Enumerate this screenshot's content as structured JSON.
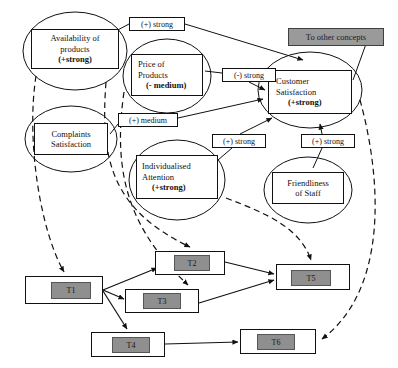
{
  "diagram": {
    "colors": {
      "line": "#111111",
      "node_fill": "#ffffff",
      "sink_fill": "#9a9a9a",
      "task_inner_fill": "#8f8f8f",
      "task_outer_fill": "#ffffff"
    },
    "concept_nodes": [
      {
        "id": "availability",
        "name": "availability-of-products",
        "line1": "Availability of",
        "line2": "products",
        "strength": "(+strong)",
        "shape": "ellipse",
        "box": {
          "x": 31,
          "y": 29,
          "w": 88,
          "h": 40
        },
        "ellipse": {
          "cx": 75,
          "cy": 51,
          "rx": 52,
          "ry": 39
        }
      },
      {
        "id": "price",
        "name": "price-of-products",
        "line1": "Price of",
        "line2": "Products",
        "strength": "(- medium)",
        "shape": "ellipse",
        "box": {
          "x": 131,
          "y": 54,
          "w": 72,
          "h": 42
        },
        "ellipse": {
          "cx": 167,
          "cy": 76,
          "rx": 44,
          "ry": 37
        }
      },
      {
        "id": "complaints",
        "name": "complaints-satisfaction",
        "line1": "Complaints",
        "line2": "Satisfaction",
        "strength": "",
        "shape": "ellipse",
        "box": {
          "x": 34,
          "y": 123,
          "w": 74,
          "h": 32
        },
        "ellipse": {
          "cx": 71,
          "cy": 139,
          "rx": 46,
          "ry": 33
        }
      },
      {
        "id": "customer",
        "name": "customer-satisfaction",
        "line1": "Customer",
        "line2": "Satisfaction",
        "strength": "(+strong)",
        "shape": "ellipse",
        "box": {
          "x": 268,
          "y": 70,
          "w": 84,
          "h": 44
        },
        "ellipse": {
          "cx": 310,
          "cy": 90,
          "rx": 52,
          "ry": 38
        }
      },
      {
        "id": "individualised",
        "name": "individualised-attention",
        "line1": "Individualised",
        "line2": "Attention",
        "strength": "(+strong)",
        "shape": "ellipse",
        "box": {
          "x": 136,
          "y": 155,
          "w": 82,
          "h": 44
        },
        "ellipse": {
          "cx": 177,
          "cy": 180,
          "rx": 48,
          "ry": 40
        }
      },
      {
        "id": "friendliness",
        "name": "friendliness-of-staff",
        "line1": "Friendliness",
        "line2": "of Staff",
        "strength": "",
        "shape": "ellipse",
        "box": {
          "x": 272,
          "y": 172,
          "w": 72,
          "h": 32
        },
        "ellipse": {
          "cx": 308,
          "cy": 190,
          "rx": 44,
          "ry": 33
        }
      }
    ],
    "sink_node": {
      "id": "other",
      "name": "to-other-concepts",
      "label": "To other concepts",
      "box": {
        "x": 288,
        "y": 28,
        "w": 96,
        "h": 18
      }
    },
    "edge_labels": [
      {
        "id": "el1",
        "name": "edge-label-plus-strong-availability",
        "text": "(+) strong",
        "box": {
          "x": 129,
          "y": 17,
          "w": 56,
          "h": 14
        }
      },
      {
        "id": "el2",
        "name": "edge-label-minus-strong-price",
        "text": "(-) strong",
        "box": {
          "x": 222,
          "y": 68,
          "w": 54,
          "h": 14
        }
      },
      {
        "id": "el3",
        "name": "edge-label-plus-medium-complaints",
        "text": "(+) medium",
        "box": {
          "x": 118,
          "y": 113,
          "w": 60,
          "h": 14
        }
      },
      {
        "id": "el4",
        "name": "edge-label-plus-strong-attention",
        "text": "(+) strong",
        "box": {
          "x": 212,
          "y": 134,
          "w": 54,
          "h": 14
        }
      },
      {
        "id": "el5",
        "name": "edge-label-plus-strong-friendliness",
        "text": "(+) strong",
        "box": {
          "x": 301,
          "y": 134,
          "w": 54,
          "h": 14
        }
      }
    ],
    "task_nodes": [
      {
        "id": "T1",
        "name": "task-node-t1",
        "label": "T1",
        "outer": {
          "x": 25,
          "y": 276,
          "w": 78,
          "h": 28
        },
        "inner": {
          "x": 51,
          "y": 282,
          "w": 40,
          "h": 17
        }
      },
      {
        "id": "T2",
        "name": "task-node-t2",
        "label": "T2",
        "outer": {
          "x": 155,
          "y": 251,
          "w": 70,
          "h": 24
        },
        "inner": {
          "x": 174,
          "y": 255,
          "w": 36,
          "h": 16
        }
      },
      {
        "id": "T3",
        "name": "task-node-t3",
        "label": "T3",
        "outer": {
          "x": 125,
          "y": 289,
          "w": 74,
          "h": 24
        },
        "inner": {
          "x": 143,
          "y": 293,
          "w": 38,
          "h": 16
        }
      },
      {
        "id": "T4",
        "name": "task-node-t4",
        "label": "T4",
        "outer": {
          "x": 91,
          "y": 332,
          "w": 74,
          "h": 25
        },
        "inner": {
          "x": 112,
          "y": 337,
          "w": 38,
          "h": 16
        }
      },
      {
        "id": "T5",
        "name": "task-node-t5",
        "label": "T5",
        "outer": {
          "x": 276,
          "y": 264,
          "w": 74,
          "h": 26
        },
        "inner": {
          "x": 291,
          "y": 270,
          "w": 40,
          "h": 16
        }
      },
      {
        "id": "T6",
        "name": "task-node-t6",
        "label": "T6",
        "outer": {
          "x": 240,
          "y": 329,
          "w": 76,
          "h": 25
        },
        "inner": {
          "x": 257,
          "y": 334,
          "w": 38,
          "h": 16
        }
      }
    ],
    "relations": [
      {
        "from": "availability",
        "to": "customer",
        "sign": "+",
        "strength": "strong",
        "style": "solid"
      },
      {
        "from": "price",
        "to": "customer",
        "sign": "-",
        "strength": "strong",
        "style": "solid"
      },
      {
        "from": "complaints",
        "to": "customer",
        "sign": "+",
        "strength": "medium",
        "style": "solid"
      },
      {
        "from": "individualised",
        "to": "customer",
        "sign": "+",
        "strength": "strong",
        "style": "solid"
      },
      {
        "from": "friendliness",
        "to": "customer",
        "sign": "+",
        "strength": "strong",
        "style": "solid"
      },
      {
        "from": "customer",
        "to": "other",
        "sign": "",
        "strength": "",
        "style": "solid"
      },
      {
        "from": "availability",
        "to": "T1",
        "sign": "",
        "strength": "",
        "style": "dashed"
      },
      {
        "from": "price",
        "to": "T3",
        "sign": "",
        "strength": "",
        "style": "dashed"
      },
      {
        "from": "complaints",
        "to": "T2",
        "sign": "",
        "strength": "",
        "style": "dashed"
      },
      {
        "from": "individualised",
        "to": "T5",
        "sign": "",
        "strength": "",
        "style": "dashed"
      },
      {
        "from": "other",
        "to": "T6",
        "sign": "",
        "strength": "",
        "style": "dashed"
      },
      {
        "from": "T1",
        "to": "T2",
        "sign": "",
        "strength": "",
        "style": "solid"
      },
      {
        "from": "T1",
        "to": "T3",
        "sign": "",
        "strength": "",
        "style": "solid"
      },
      {
        "from": "T1",
        "to": "T4",
        "sign": "",
        "strength": "",
        "style": "solid"
      },
      {
        "from": "T2",
        "to": "T5",
        "sign": "",
        "strength": "",
        "style": "solid"
      },
      {
        "from": "T3",
        "to": "T5",
        "sign": "",
        "strength": "",
        "style": "solid"
      },
      {
        "from": "T4",
        "to": "T6",
        "sign": "",
        "strength": "",
        "style": "solid"
      }
    ]
  }
}
